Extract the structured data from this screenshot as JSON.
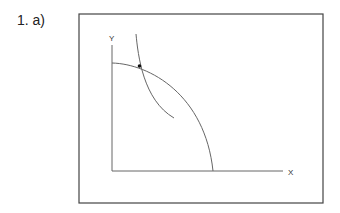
{
  "question": {
    "label": "1. a)"
  },
  "diagram": {
    "type": "ppf-indifference",
    "axes": {
      "y_label": "Y",
      "x_label": "X"
    },
    "curves": [
      {
        "name": "production-possibility-frontier",
        "shape": "concave arc from Y-axis to X-axis"
      },
      {
        "name": "indifference-curve",
        "shape": "convex downward-sloping curve"
      }
    ],
    "points": [
      {
        "name": "tangency-point",
        "description": "intersection of PPF and indifference curve"
      }
    ],
    "colors": {
      "frame": "#444444",
      "lines": "#666666",
      "point": "#111111"
    }
  }
}
